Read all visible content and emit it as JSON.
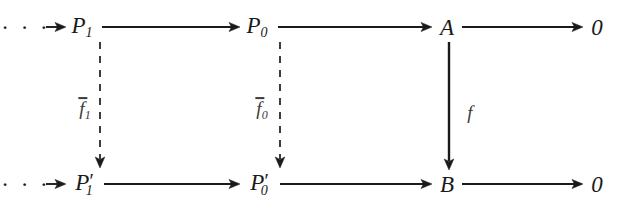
{
  "diagram": {
    "type": "commutative-diagram",
    "background_color": "#ffffff",
    "ink_color": "#1a1a1a",
    "label_color": "#3a3a3a",
    "rows": [
      {
        "id": "top-row",
        "leading_dots": "· · ·",
        "nodes": [
          {
            "id": "P1",
            "base": "P",
            "sub": "1",
            "prime": "",
            "x": 82,
            "y": 27
          },
          {
            "id": "P0",
            "base": "P",
            "sub": "0",
            "prime": "",
            "x": 257,
            "y": 27
          },
          {
            "id": "A",
            "base": "A",
            "sub": "",
            "prime": "",
            "x": 447,
            "y": 27
          }
        ],
        "terminal": "0",
        "terminal_x": 597,
        "terminal_y": 27
      },
      {
        "id": "bottom-row",
        "leading_dots": "· · ·",
        "nodes": [
          {
            "id": "P1p",
            "base": "P",
            "sub": "1",
            "prime": "′",
            "x": 82,
            "y": 184
          },
          {
            "id": "P0p",
            "base": "P",
            "sub": "0",
            "prime": "′",
            "x": 257,
            "y": 184
          },
          {
            "id": "B",
            "base": "B",
            "sub": "",
            "prime": "",
            "x": 447,
            "y": 184
          }
        ],
        "terminal": "0",
        "terminal_x": 597,
        "terminal_y": 184
      }
    ],
    "vertical_maps": [
      {
        "id": "f-bar-1",
        "base": "f",
        "sub": "1",
        "overbar": true,
        "style": "dashed",
        "from": "P1",
        "to": "P1p",
        "x": 100,
        "label_x": 85,
        "label_y": 110,
        "y_start": 42,
        "y_end": 168
      },
      {
        "id": "f-bar-0",
        "base": "f",
        "sub": "0",
        "overbar": true,
        "style": "dashed",
        "from": "P0",
        "to": "P0p",
        "x": 280,
        "label_x": 262,
        "label_y": 110,
        "y_start": 42,
        "y_end": 168
      },
      {
        "id": "f",
        "base": "f",
        "sub": "",
        "overbar": false,
        "style": "solid",
        "from": "A",
        "to": "B",
        "x": 449,
        "label_x": 470,
        "label_y": 112,
        "y_start": 42,
        "y_end": 170
      }
    ],
    "horizontal_arrows": [
      {
        "id": "dots-to-P1-top",
        "x1": 46,
        "x2": 66,
        "y": 27,
        "style": "solid"
      },
      {
        "id": "P1-to-P0-top",
        "x1": 102,
        "x2": 240,
        "y": 27,
        "style": "solid"
      },
      {
        "id": "P0-to-A-top",
        "x1": 278,
        "x2": 432,
        "y": 27,
        "style": "solid"
      },
      {
        "id": "A-to-zero-top",
        "x1": 462,
        "x2": 583,
        "y": 27,
        "style": "solid"
      },
      {
        "id": "dots-to-P1-bot",
        "x1": 46,
        "x2": 66,
        "y": 184,
        "style": "solid"
      },
      {
        "id": "P1p-to-P0p-bot",
        "x1": 104,
        "x2": 240,
        "y": 184,
        "style": "solid"
      },
      {
        "id": "P0p-to-B-bot",
        "x1": 280,
        "x2": 432,
        "y": 184,
        "style": "solid"
      },
      {
        "id": "B-to-zero-bot",
        "x1": 462,
        "x2": 583,
        "y": 184,
        "style": "solid"
      }
    ]
  }
}
